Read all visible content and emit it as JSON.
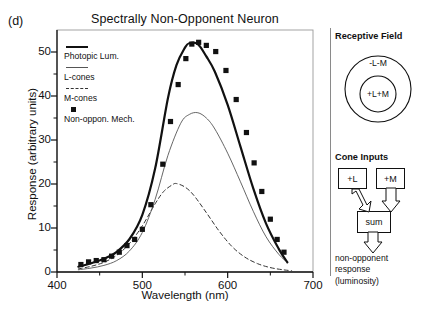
{
  "figure": {
    "panel_label": "(d)",
    "title": "Spectrally Non-Opponent Neuron"
  },
  "legend": {
    "items": [
      {
        "label": "Photopic Lum.",
        "key": "thick-solid-line"
      },
      {
        "label": "L-cones",
        "key": "thin-solid-line"
      },
      {
        "label": "M-cones",
        "key": "dashed-line"
      },
      {
        "label": "Non-oppon. Mech.",
        "key": "filled-square-marker"
      }
    ]
  },
  "axes": {
    "x_title": "Wavelength (nm)",
    "y_title": "Response (arbitrary units)",
    "x_ticks": [
      "400",
      "500",
      "600",
      "700"
    ],
    "y_ticks": [
      "0",
      "10",
      "20",
      "30",
      "40",
      "50"
    ]
  },
  "receptive_field": {
    "title": "Receptive Field",
    "surround_label": "-L-M",
    "center_label": "+L+M"
  },
  "cone_inputs": {
    "title": "Cone Inputs",
    "l_box": "+L",
    "m_box": "+M",
    "sum_box": "sum",
    "output_line1": "non-opponent",
    "output_line2": "response",
    "output_line3": "(luminosity)"
  },
  "chart_data": {
    "type": "line",
    "title": "Spectrally Non-Opponent Neuron",
    "xlabel": "Wavelength (nm)",
    "ylabel": "Response (arbitrary units)",
    "xlim": [
      400,
      700
    ],
    "ylim": [
      0,
      55
    ],
    "grid": false,
    "legend_position": "upper-left-inside",
    "x_tick_values": [
      400,
      500,
      600,
      700
    ],
    "x_minor_tick_values": [
      450,
      550,
      650
    ],
    "y_tick_values": [
      0,
      10,
      20,
      30,
      40,
      50
    ],
    "y_minor_tick_values": [
      5,
      15,
      25,
      35,
      45
    ],
    "series": [
      {
        "name": "Photopic Lum.",
        "style": "thick-solid",
        "color": "#111111",
        "x": [
          425,
          440,
          455,
          470,
          485,
          500,
          515,
          530,
          540,
          550,
          555,
          565,
          575,
          585,
          600,
          615,
          630,
          645,
          660,
          670
        ],
        "y": [
          1.2,
          2.0,
          3.0,
          4.6,
          7.5,
          13.0,
          23.5,
          39.5,
          47.0,
          51.0,
          52.0,
          51.8,
          49.0,
          45.5,
          38.0,
          28.5,
          19.0,
          11.0,
          5.2,
          2.2
        ]
      },
      {
        "name": "L-cones",
        "style": "thin-solid",
        "color": "#555555",
        "x": [
          425,
          440,
          455,
          470,
          485,
          500,
          515,
          530,
          545,
          555,
          565,
          575,
          585,
          600,
          615,
          630,
          645,
          660,
          670
        ],
        "y": [
          0.5,
          0.9,
          1.5,
          2.6,
          4.8,
          9.0,
          16.5,
          26.5,
          33.8,
          35.8,
          36.2,
          35.0,
          32.5,
          27.0,
          20.5,
          13.8,
          8.0,
          4.0,
          2.2
        ]
      },
      {
        "name": "M-cones",
        "style": "dashed",
        "color": "#333333",
        "x": [
          425,
          440,
          455,
          470,
          485,
          500,
          515,
          525,
          535,
          540,
          550,
          560,
          575,
          590,
          605,
          620,
          635,
          650,
          665,
          675
        ],
        "y": [
          0.7,
          1.3,
          2.2,
          3.8,
          6.5,
          10.5,
          15.5,
          18.3,
          19.8,
          20.1,
          19.3,
          17.5,
          13.5,
          9.3,
          5.8,
          3.4,
          1.9,
          1.0,
          0.5,
          0.3
        ]
      }
    ],
    "scatter": {
      "name": "Non-oppon. Mech.",
      "marker": "filled-square",
      "color": "#111111",
      "x": [
        428,
        437,
        446,
        455,
        464,
        473,
        482,
        491,
        500,
        510,
        524,
        533,
        542,
        551,
        558,
        566,
        575,
        586,
        598,
        610,
        622,
        631,
        640,
        650,
        658,
        666
      ],
      "y": [
        1.7,
        2.3,
        2.6,
        2.8,
        3.6,
        4.5,
        6.0,
        7.4,
        9.7,
        15.3,
        24.5,
        34.2,
        42.6,
        48.5,
        51.8,
        52.2,
        51.5,
        50.1,
        45.8,
        39.2,
        31.7,
        24.8,
        18.3,
        12.0,
        7.4,
        4.5,
        2.1
      ]
    }
  }
}
